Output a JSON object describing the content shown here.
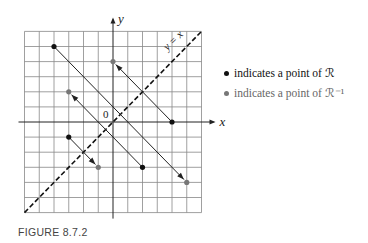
{
  "figure": {
    "caption": "FIGURE 8.7.2",
    "x_label": "x",
    "y_label": "y",
    "origin_label": "0",
    "diagonal_label": "y = x",
    "grid": {
      "xmin": -6,
      "xmax": 6,
      "ymin": -6,
      "ymax": 6
    },
    "pairs": [
      {
        "from": [
          -4,
          5
        ],
        "to": [
          5,
          -4
        ]
      },
      {
        "from": [
          4,
          0
        ],
        "to": [
          0,
          4
        ]
      },
      {
        "from": [
          2,
          -3
        ],
        "to": [
          -3,
          2
        ]
      },
      {
        "from": [
          -3,
          -1
        ],
        "to": [
          -1,
          -3
        ]
      }
    ],
    "colors": {
      "r_point": "#111111",
      "rinv_point": "#777777",
      "grid": "#888888",
      "axis": "#222222"
    }
  },
  "legend": {
    "r_text": "indicates a point of ℛ",
    "rinv_text": "indicates a point of ℛ⁻¹"
  }
}
